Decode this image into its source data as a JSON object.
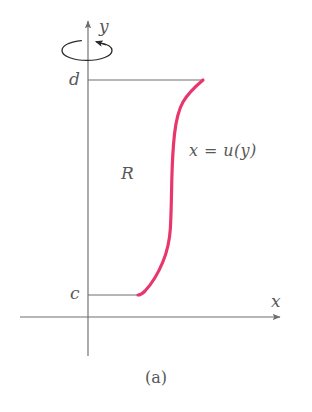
{
  "figure": {
    "caption": "(a)",
    "background_color": "#ffffff",
    "axis_color": "#6e6e70",
    "curve_color": "#e8376c",
    "label_color": "#58585a",
    "width": 312,
    "height": 412
  },
  "axes": {
    "x_axis": {
      "label": "x",
      "icon": "arrow-right-icon",
      "origin_px": {
        "x": 88,
        "y": 317
      },
      "start_px": {
        "x": 20,
        "y": 317
      },
      "end_px": {
        "x": 283,
        "y": 317
      }
    },
    "y_axis": {
      "label": "y",
      "icon": "arrow-up-icon",
      "top_px": {
        "x": 88,
        "y": 18
      },
      "bottom_px": {
        "x": 88,
        "y": 356
      }
    }
  },
  "bounds": {
    "upper_limit_label": "d",
    "upper_limit_y_px": 80,
    "lower_limit_label": "c",
    "lower_limit_y_px": 295,
    "upper_segment_px": {
      "x1": 88,
      "y1": 80,
      "x2": 203,
      "y2": 80
    },
    "lower_segment_px": {
      "x1": 88,
      "y1": 295,
      "x2": 138,
      "y2": 295
    }
  },
  "region": {
    "label": "R",
    "description": "region bounded by the y-axis, the lines y = c and y = d, and the curve x = u(y)"
  },
  "curve": {
    "equation_label": "x = u(y)",
    "color": "#e8376c",
    "stroke_width": 3.2,
    "shape": "sigmoid",
    "points_px": [
      {
        "x": 203,
        "y": 80
      },
      {
        "x": 196,
        "y": 85
      },
      {
        "x": 188,
        "y": 93
      },
      {
        "x": 182,
        "y": 103
      },
      {
        "x": 178,
        "y": 115
      },
      {
        "x": 175,
        "y": 132
      },
      {
        "x": 173,
        "y": 152
      },
      {
        "x": 172,
        "y": 176
      },
      {
        "x": 171,
        "y": 200
      },
      {
        "x": 170,
        "y": 222
      },
      {
        "x": 168,
        "y": 240
      },
      {
        "x": 164,
        "y": 256
      },
      {
        "x": 158,
        "y": 271
      },
      {
        "x": 150,
        "y": 284
      },
      {
        "x": 143,
        "y": 292
      },
      {
        "x": 138,
        "y": 295
      }
    ]
  },
  "rotation_indicator": {
    "icon": "rotation-arrow-icon",
    "description": "counter-clockwise revolution arrow about the y-axis",
    "center_px": {
      "x": 87,
      "y": 50
    },
    "radius_x_px": 25,
    "radius_y_px": 10
  }
}
